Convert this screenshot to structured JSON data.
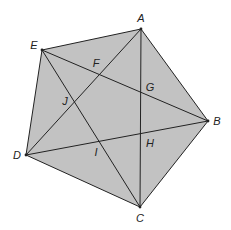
{
  "diagram": {
    "type": "regular pentagon with all diagonals (pentagram)",
    "fill_color": "#c2c2c2",
    "line_color": "#222222",
    "vertices": [
      {
        "name": "A",
        "x": 141,
        "y": 29,
        "label_x": 141,
        "label_y": 22
      },
      {
        "name": "B",
        "x": 208,
        "y": 121,
        "label_x": 217,
        "label_y": 125
      },
      {
        "name": "C",
        "x": 140,
        "y": 207,
        "label_x": 140,
        "label_y": 222
      },
      {
        "name": "D",
        "x": 26,
        "y": 155,
        "label_x": 17,
        "label_y": 159
      },
      {
        "name": "E",
        "x": 42,
        "y": 50,
        "label_x": 34,
        "label_y": 49
      }
    ],
    "intersections": [
      {
        "name": "F",
        "x": 100,
        "y": 75,
        "label_x": 96,
        "label_y": 67
      },
      {
        "name": "G",
        "x": 141,
        "y": 92,
        "label_x": 150,
        "label_y": 91
      },
      {
        "name": "H",
        "x": 141,
        "y": 134,
        "label_x": 150,
        "label_y": 147
      },
      {
        "name": "I",
        "x": 99,
        "y": 142,
        "label_x": 96,
        "label_y": 156
      },
      {
        "name": "J",
        "x": 74,
        "y": 102,
        "label_x": 65,
        "label_y": 105
      }
    ],
    "sides": [
      "AB",
      "BC",
      "CD",
      "DE",
      "EA"
    ],
    "diagonals": [
      "AC",
      "AD",
      "BD",
      "BE",
      "CE"
    ]
  }
}
